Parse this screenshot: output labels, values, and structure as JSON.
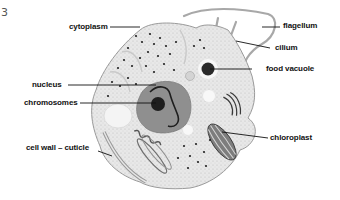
{
  "figure": {
    "number": "3",
    "labels": {
      "cytoplasm": "cytoplasm",
      "flagellum": "flagellum",
      "cilium": "cilium",
      "food_vacuole": "food vacuole",
      "nucleus": "nucleus",
      "chromosomes": "chromosomes",
      "chloroplast": "chloroplast",
      "cell_wall": "cell wall – cuticle"
    }
  },
  "colors": {
    "cell_fill": "#e6e6e6",
    "cell_edge": "#9a9a9a",
    "nucleus_fill": "#8c8c8c",
    "dark": "#1e1e1e",
    "leader": "#111111"
  }
}
